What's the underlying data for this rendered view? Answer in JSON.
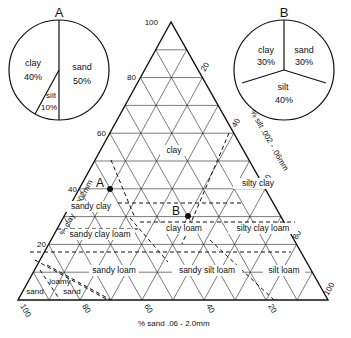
{
  "pie_a": {
    "title": "A",
    "slices": [
      {
        "label": "clay",
        "pct": "40%",
        "value": 40
      },
      {
        "label": "sand",
        "pct": "50%",
        "value": 50
      },
      {
        "label": "silt",
        "pct": "10%",
        "value": 10
      }
    ]
  },
  "pie_b": {
    "title": "B",
    "slices": [
      {
        "label": "clay",
        "pct": "30%",
        "value": 30
      },
      {
        "label": "sand",
        "pct": "30%",
        "value": 30
      },
      {
        "label": "silt",
        "pct": "40%",
        "value": 40
      }
    ]
  },
  "axes": {
    "clay_label": "% clay  <  .002mm",
    "silt_label": "% silt .002 - .06mm",
    "sand_label": "% sand .06 - 2.0mm",
    "clay_ticks": [
      "100",
      "80",
      "60",
      "40",
      "20"
    ],
    "silt_ticks": [
      "20",
      "40",
      "60",
      "80",
      "100"
    ],
    "sand_ticks": [
      "100",
      "80",
      "60",
      "40",
      "20"
    ]
  },
  "regions": {
    "clay": "clay",
    "silty_clay": "silty clay",
    "sandy_clay": "sandy clay",
    "clay_loam": "clay loam",
    "silty_clay_loam": "silty clay loam",
    "sandy_clay_loam": "sandy clay loam",
    "sandy_loam": "sandy loam",
    "sandy_silt_loam": "sandy silt loam",
    "silt_loam": "silt loam",
    "loamy_sand_1": "loamy",
    "loamy_sand_2": "sand",
    "sand": "sand"
  },
  "points": {
    "a": {
      "label": "A",
      "clay": 40,
      "silt": 10,
      "sand": 50
    },
    "b": {
      "label": "B",
      "clay": 30,
      "silt": 40,
      "sand": 30
    }
  }
}
